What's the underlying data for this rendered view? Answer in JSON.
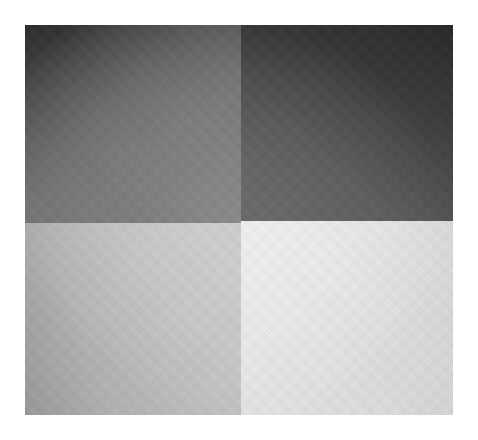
{
  "image": {
    "description": "Grayscale photograph of a square divided into four quadrants of differing lightness",
    "layout": "2x2 quadrants",
    "quadrants": [
      {
        "position": "top-left",
        "tone": "dark-to-medium gray",
        "color": "#6e6e6e"
      },
      {
        "position": "top-right",
        "tone": "dark gray",
        "color": "#3a3a3a"
      },
      {
        "position": "bottom-left",
        "tone": "light gray",
        "color": "#bcbcbc"
      },
      {
        "position": "bottom-right",
        "tone": "very light gray",
        "color": "#e6e6e6"
      }
    ],
    "background_color": "#ffffff"
  }
}
